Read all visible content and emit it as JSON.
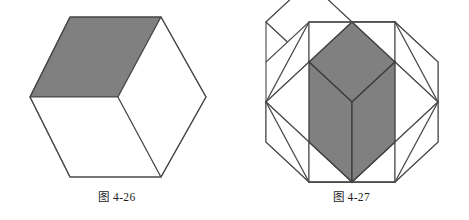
{
  "page": {
    "background_color": "#ffffff",
    "width": 469,
    "height": 220,
    "kind": "textbook-figure-pair"
  },
  "style": {
    "stroke_color": "#4a4a4a",
    "stroke_color_dark": "#3a3a3a",
    "fill_white": "#ffffff",
    "fill_gray": "#808080",
    "stroke_width": 1.1,
    "text_color": "#1c1c1c"
  },
  "figures": [
    {
      "id": "figure-4-26",
      "caption": "图 4-26",
      "caption_label": "图",
      "caption_number": "4-26",
      "description": "Hexagon drawn as an isometric cube: three rhombi meeting at the centre; the top rhombus is shaded gray.",
      "shape": "hexagon",
      "subdivision": "3 rhombi (single cube)",
      "shaded_count": 1,
      "total_cells": 3,
      "hexagon": {
        "center_x": 118,
        "center_y": 97,
        "half_width": 88,
        "half_height": 80,
        "top_y": 17,
        "bottom_y": 177,
        "left_x": 30,
        "right_x": 206,
        "flat_top_half": 46
      },
      "shaded_cells": [
        "top"
      ],
      "white_cells": [
        "left",
        "right"
      ]
    },
    {
      "id": "figure-4-27",
      "caption": "图 4-27",
      "caption_label": "图",
      "caption_number": "4-27",
      "description": "Hexagon of side 2 filled with a rhombille tiling of twelve rhombi (four isometric cubes); the central cube's three rhombi are shaded gray.",
      "shape": "hexagon",
      "subdivision": "12 rhombi (four cubes)",
      "shaded_count": 3,
      "total_cells": 12,
      "hexagon": {
        "center_x": 352,
        "center_y": 102,
        "half_width": 86,
        "half_height": 80,
        "top_y": 22,
        "bottom_y": 182,
        "left_x": 266,
        "right_x": 438,
        "flat_top_half": 43
      },
      "shaded_cells": [
        "center-top",
        "center-left",
        "center-right"
      ],
      "white_cells": [
        "upper-left-top",
        "upper-left-left",
        "upper-left-right",
        "upper-right-top",
        "upper-right-left",
        "upper-right-right",
        "lower-top",
        "lower-left",
        "lower-right"
      ]
    }
  ]
}
